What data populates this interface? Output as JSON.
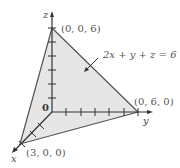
{
  "diagram": {
    "equation_label": "2x + y + z = 6",
    "axes": {
      "x_label": "x",
      "y_label": "y",
      "z_label": "z",
      "origin_label": "0"
    },
    "vertices": [
      {
        "name": "z-intercept",
        "label": "(0, 0, 6)"
      },
      {
        "name": "y-intercept",
        "label": "(0, 6, 0)"
      },
      {
        "name": "x-intercept",
        "label": "(3, 0, 0)"
      }
    ],
    "colors": {
      "plane_fill": "#e6e6e6",
      "edge": "#555555",
      "axis": "#333333",
      "text": "#555555"
    }
  }
}
